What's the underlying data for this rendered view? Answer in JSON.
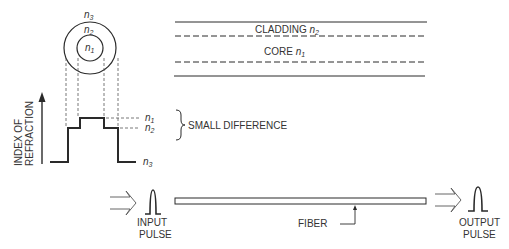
{
  "cross_section": {
    "outer_label": "n",
    "outer_sub": "3",
    "ring_label": "n",
    "ring_sub": "2",
    "inner_label": "n",
    "inner_sub": "1"
  },
  "profile": {
    "axis_label_line1": "INDEX OF",
    "axis_label_line2": "REFRACTION",
    "n1_label": "n",
    "n1_sub": "1",
    "n2_label": "n",
    "n2_sub": "2",
    "n3_label": "n",
    "n3_sub": "3",
    "brace_note": "SMALL DIFFERENCE"
  },
  "fiber_view": {
    "cladding_label": "CLADDING ",
    "cladding_n": "n",
    "cladding_sub": "2",
    "core_label": "CORE ",
    "core_n": "n",
    "core_sub": "1"
  },
  "transmission": {
    "input_line1": "INPUT",
    "input_line2": "PULSE",
    "fiber_label": "FIBER",
    "output_line1": "OUTPUT",
    "output_line2": "PULSE"
  },
  "colors": {
    "line": "#2a2a2a",
    "dashed": "#555555",
    "background": "#ffffff"
  }
}
